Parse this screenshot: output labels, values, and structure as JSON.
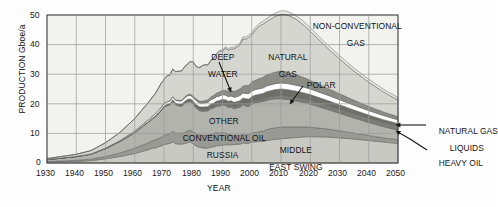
{
  "figure": {
    "background": "#fdfdfd",
    "plot_background": "#f2f2ef",
    "frame_color": "#4a4a4a",
    "grid_color": "#9a9a9a"
  },
  "axes": {
    "x_title": "YEAR",
    "y_title": "PRODUCTION Gboe/a",
    "x_ticks": [
      "1930",
      "1940",
      "1950",
      "1960",
      "1970",
      "1980",
      "1990",
      "2000",
      "2010",
      "2020",
      "2030",
      "2040",
      "2050"
    ],
    "y_ticks": [
      "0",
      "10",
      "20",
      "30",
      "40",
      "50"
    ]
  },
  "annotations": [
    {
      "id": "deep-water",
      "line1": "DEEP",
      "line2": "WATER"
    },
    {
      "id": "natural-gas",
      "line1": "NATURAL",
      "line2": "GAS"
    },
    {
      "id": "non-conventional-gas",
      "line1": "NON-CONVENTIONAL",
      "line2": "GAS"
    },
    {
      "id": "polar",
      "line1": "POLAR",
      "line2": ""
    },
    {
      "id": "other-conventional-oil",
      "line1": "OTHER",
      "line2": "CONVENTIONAL OIL"
    },
    {
      "id": "russia",
      "line1": "RUSSIA",
      "line2": ""
    },
    {
      "id": "middle-east-swing",
      "line1": "MIDDLE",
      "line2": "EAST SWING"
    },
    {
      "id": "natural-gas-liquids",
      "line1": "NATURAL GAS",
      "line2": "LIQUIDS"
    },
    {
      "id": "heavy-oil",
      "line1": "HEAVY OIL",
      "line2": ""
    }
  ],
  "chart_data": {
    "type": "area",
    "stacked": true,
    "title": "",
    "xlabel": "YEAR",
    "ylabel": "PRODUCTION Gboe/a",
    "xlim": [
      1930,
      2050
    ],
    "ylim": [
      0,
      50
    ],
    "grid": true,
    "legend": "inline-annotations",
    "x": [
      1930,
      1935,
      1940,
      1945,
      1950,
      1955,
      1960,
      1965,
      1970,
      1973,
      1975,
      1979,
      1982,
      1985,
      1988,
      1990,
      1992,
      1995,
      1998,
      2000,
      2003,
      2005,
      2008,
      2010,
      2012,
      2015,
      2018,
      2020,
      2025,
      2030,
      2035,
      2040,
      2045,
      2050
    ],
    "series": [
      {
        "name": "MIDDLE EAST SWING",
        "color": "#c9c9c4",
        "values": [
          0.3,
          0.4,
          0.5,
          0.8,
          1.4,
          2.2,
          3.2,
          4.6,
          6.2,
          7.0,
          6.2,
          7.1,
          5.2,
          5.0,
          5.8,
          6.2,
          6.1,
          6.4,
          6.8,
          7.0,
          7.2,
          7.6,
          8.0,
          8.2,
          8.4,
          8.6,
          8.8,
          8.9,
          8.8,
          8.5,
          8.1,
          7.6,
          7.1,
          6.6
        ]
      },
      {
        "name": "RUSSIA",
        "color": "#9a9a95",
        "values": [
          0.2,
          0.3,
          0.4,
          0.5,
          0.8,
          1.2,
          1.8,
          2.4,
          3.1,
          3.4,
          3.6,
          4.0,
          4.2,
          4.3,
          4.4,
          4.2,
          3.6,
          3.0,
          2.8,
          3.0,
          3.4,
          3.7,
          3.9,
          3.9,
          3.8,
          3.6,
          3.4,
          3.2,
          2.8,
          2.4,
          2.0,
          1.7,
          1.4,
          1.2
        ]
      },
      {
        "name": "OTHER CONVENTIONAL OIL",
        "color": "#b3b3ae",
        "values": [
          0.6,
          0.9,
          1.2,
          1.6,
          2.6,
          3.8,
          5.2,
          7.0,
          9.2,
          10.0,
          9.2,
          10.0,
          8.4,
          8.2,
          8.8,
          9.0,
          9.1,
          9.4,
          9.8,
          9.9,
          9.8,
          9.9,
          9.8,
          9.6,
          9.3,
          8.8,
          8.2,
          7.8,
          6.8,
          5.9,
          5.1,
          4.4,
          3.8,
          3.3
        ]
      },
      {
        "name": "HEAVY OIL",
        "color": "#7d7d78",
        "values": [
          0.05,
          0.05,
          0.06,
          0.08,
          0.1,
          0.15,
          0.2,
          0.25,
          0.3,
          0.35,
          0.4,
          0.45,
          0.5,
          0.55,
          0.6,
          0.65,
          0.7,
          0.75,
          0.8,
          0.85,
          0.9,
          1.0,
          1.1,
          1.2,
          1.25,
          1.3,
          1.35,
          1.4,
          1.45,
          1.5,
          1.5,
          1.5,
          1.5,
          1.5
        ]
      },
      {
        "name": "POLAR",
        "color": "#6f6f6a",
        "values": [
          0.0,
          0.0,
          0.0,
          0.0,
          0.0,
          0.0,
          0.02,
          0.05,
          0.1,
          0.15,
          0.25,
          0.5,
          0.8,
          1.0,
          1.2,
          1.3,
          1.4,
          1.5,
          1.6,
          1.7,
          1.8,
          1.9,
          2.0,
          2.1,
          2.1,
          2.0,
          1.9,
          1.8,
          1.6,
          1.4,
          1.2,
          1.0,
          0.85,
          0.7
        ]
      },
      {
        "name": "NATURAL GAS LIQUIDS",
        "color": "#ffffff",
        "values": [
          0.05,
          0.06,
          0.08,
          0.1,
          0.15,
          0.25,
          0.4,
          0.6,
          0.85,
          0.95,
          1.0,
          1.2,
          1.3,
          1.4,
          1.5,
          1.55,
          1.6,
          1.7,
          1.8,
          1.85,
          1.9,
          1.95,
          2.0,
          2.05,
          2.05,
          2.0,
          1.95,
          1.9,
          1.8,
          1.7,
          1.6,
          1.5,
          1.4,
          1.3
        ]
      },
      {
        "name": "DEEP WATER",
        "color": "#8c8c87",
        "values": [
          0.0,
          0.0,
          0.0,
          0.0,
          0.0,
          0.0,
          0.0,
          0.0,
          0.05,
          0.1,
          0.2,
          0.4,
          0.6,
          0.9,
          1.2,
          1.4,
          1.7,
          2.1,
          2.6,
          3.0,
          3.4,
          3.7,
          3.9,
          4.0,
          3.9,
          3.6,
          3.2,
          2.9,
          2.4,
          2.0,
          1.7,
          1.4,
          1.2,
          1.0
        ]
      },
      {
        "name": "NATURAL GAS",
        "color": "#d6d6d1",
        "values": [
          0.3,
          0.5,
          0.7,
          1.1,
          1.8,
          2.8,
          4.2,
          6.0,
          8.2,
          9.2,
          9.6,
          11.0,
          11.4,
          12.0,
          13.0,
          13.6,
          14.0,
          14.8,
          15.8,
          16.5,
          17.4,
          18.0,
          18.8,
          19.2,
          19.3,
          18.8,
          17.6,
          16.6,
          14.0,
          11.8,
          9.8,
          8.2,
          6.8,
          5.6
        ]
      },
      {
        "name": "NON-CONVENTIONAL GAS",
        "color": "#e8e8e4",
        "values": [
          0.0,
          0.0,
          0.0,
          0.0,
          0.0,
          0.0,
          0.0,
          0.0,
          0.0,
          0.0,
          0.0,
          0.05,
          0.1,
          0.2,
          0.3,
          0.4,
          0.5,
          0.6,
          0.7,
          0.8,
          0.9,
          1.0,
          1.1,
          1.2,
          1.2,
          1.2,
          1.2,
          1.2,
          1.1,
          1.1,
          1.0,
          1.0,
          0.9,
          0.9
        ]
      }
    ],
    "total_peak": {
      "year": 2011,
      "value": 48
    }
  }
}
